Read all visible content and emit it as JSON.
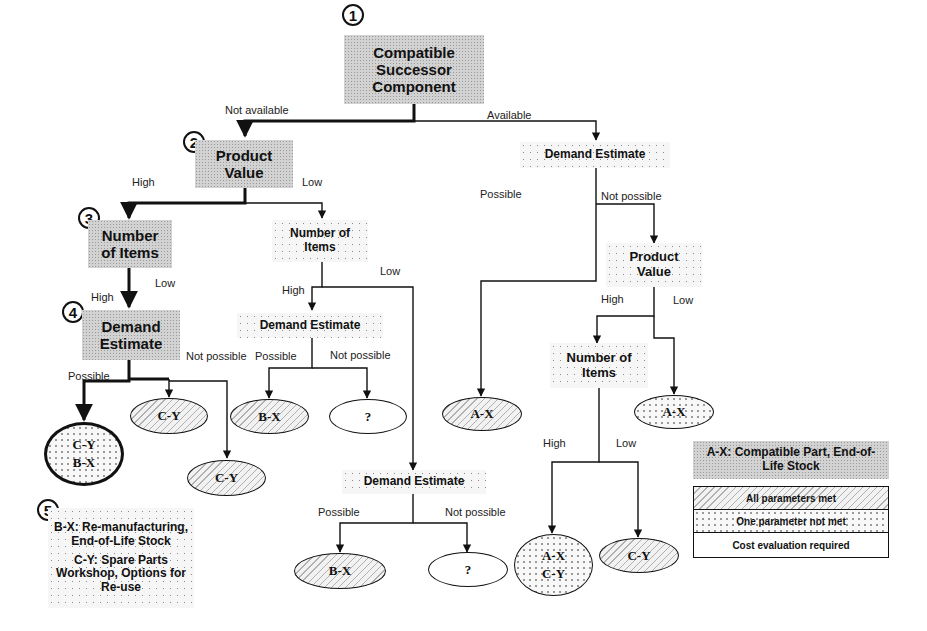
{
  "nodes": {
    "n1": {
      "number": "1",
      "label": "Compatible Successor Component"
    },
    "n2": {
      "number": "2",
      "label": "Product Value"
    },
    "n3": {
      "number": "3",
      "label": "Number of Items"
    },
    "n4": {
      "number": "4",
      "label": "Demand Estimate"
    },
    "mid_items": {
      "label": "Number of Items"
    },
    "mid_demand": {
      "label": "Demand Estimate"
    },
    "low_demand": {
      "label": "Demand Estimate"
    },
    "right_demand": {
      "label": "Demand Estimate"
    },
    "right_value": {
      "label": "Product Value"
    },
    "right_items": {
      "label": "Number of Items"
    }
  },
  "edges": {
    "not_available": "Not available",
    "available": "Available",
    "pv_high": "High",
    "pv_low": "Low",
    "ni_low": "Low",
    "ni_high": "High",
    "de4_possible": "Possible",
    "de4_not_possible": "Not possible",
    "mid_ni_high": "High",
    "mid_ni_low": "Low",
    "mid_de_possible": "Possible",
    "mid_de_not_possible": "Not possible",
    "low_de_possible": "Possible",
    "low_de_not_possible": "Not possible",
    "right_de_possible": "Possible",
    "right_de_not_possible": "Not possible",
    "right_pv_high": "High",
    "right_pv_low": "Low",
    "right_ni_high": "High",
    "right_ni_low": "Low"
  },
  "outcomes": {
    "cy_bx_bold": {
      "line1": "C-Y",
      "line2": "B-X",
      "style": "one-parameter-not-met"
    },
    "cy_top": {
      "line1": "C-Y",
      "style": "all-parameters-met"
    },
    "cy_low": {
      "line1": "C-Y",
      "style": "all-parameters-met"
    },
    "bx_mid": {
      "line1": "B-X",
      "style": "all-parameters-met"
    },
    "q_mid": {
      "line1": "?",
      "style": "cost-evaluation-required"
    },
    "bx_low": {
      "line1": "B-X",
      "style": "all-parameters-met"
    },
    "q_low": {
      "line1": "?",
      "style": "cost-evaluation-required"
    },
    "ax_left": {
      "line1": "A-X",
      "style": "all-parameters-met"
    },
    "ax_right": {
      "line1": "A-X",
      "style": "one-parameter-not-met"
    },
    "ax_cy": {
      "line1": "A-X",
      "line2": "C-Y",
      "style": "one-parameter-not-met"
    },
    "cy_right": {
      "line1": "C-Y",
      "style": "all-parameters-met"
    }
  },
  "note5": {
    "number": "5",
    "bx": "B-X: Re-manufacturing, End-of-Life Stock",
    "cy": "C-Y: Spare Parts Workshop, Options for Re-use"
  },
  "ax_note": "A-X: Compatible Part, End-of-Life Stock",
  "legend": {
    "items": [
      {
        "label": "All parameters met",
        "style": "hatched"
      },
      {
        "label": "One parameter not met",
        "style": "dotted"
      },
      {
        "label": "Cost evaluation required",
        "style": "plain"
      }
    ]
  }
}
